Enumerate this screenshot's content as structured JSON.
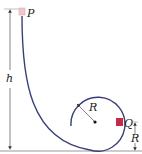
{
  "diagram": {
    "labels": {
      "start_point": "P",
      "height": "h",
      "loop_radius": "R",
      "point_on_loop": "Q",
      "q_height": "R"
    },
    "colors": {
      "track": "#3a3f7a",
      "block_p": "#f0c8d0",
      "block_q": "#c8284a",
      "ground": "#9a9a9a",
      "dimension": "#333333"
    }
  }
}
